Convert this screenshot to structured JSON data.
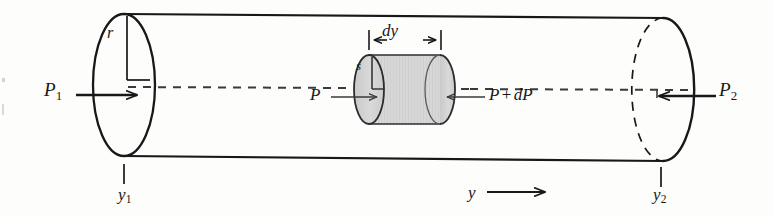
{
  "figure": {
    "type": "physics-diagram",
    "colors": {
      "stroke": "#18181a",
      "fill_element": "#d6d6d6",
      "background": "#fdfdfc",
      "dash_stroke": "#2a2a2c"
    }
  },
  "labels": {
    "pressure_inlet": "P",
    "pressure_inlet_sub": "1",
    "pressure_outlet": "P",
    "pressure_outlet_sub": "2",
    "pressure_element_left": "P",
    "pressure_element_right_base": "P",
    "pressure_element_right_op": "+",
    "pressure_element_right_delta": "dP",
    "radius": "r",
    "element_radius": "s",
    "element_length": "dy",
    "position_start": "y",
    "position_start_sub": "1",
    "position_end": "y",
    "position_end_sub": "2",
    "axis": "y"
  },
  "geometry": {
    "pipe_radius_label": "r",
    "element_radius_label": "s",
    "element_width_label": "dy",
    "flow_direction": "left-to-right"
  }
}
